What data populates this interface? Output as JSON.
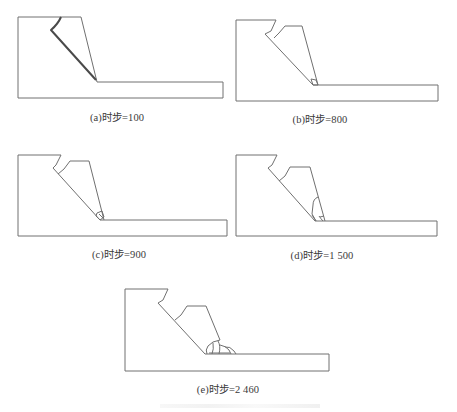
{
  "figure": {
    "panels": [
      {
        "id": "a",
        "caption": "(a)时步=100",
        "timestep": 100
      },
      {
        "id": "b",
        "caption": "(b)时步=800",
        "timestep": 800
      },
      {
        "id": "c",
        "caption": "(c)时步=900",
        "timestep": 900
      },
      {
        "id": "d",
        "caption": "(d)时步=1 500",
        "timestep": 1500
      },
      {
        "id": "e",
        "caption": "(e)时步=2 460",
        "timestep": 2460
      }
    ],
    "colors": {
      "outline": "#6a6a6a",
      "failure_surface": "#444444",
      "background": "#ffffff"
    }
  }
}
